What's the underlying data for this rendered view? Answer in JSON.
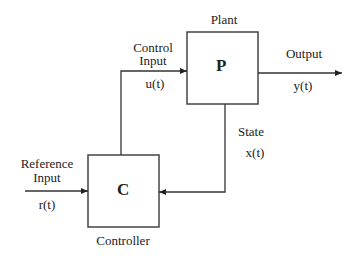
{
  "diagram": {
    "type": "control-system-block-diagram",
    "blocks": {
      "plant": {
        "symbol": "P",
        "title": "Plant"
      },
      "controller": {
        "symbol": "C",
        "title": "Controller"
      }
    },
    "signals": {
      "reference": {
        "line1": "Reference",
        "line2": "Input",
        "var": "r(t)"
      },
      "control": {
        "line1": "Control",
        "line2": "Input",
        "var": "u(t)"
      },
      "output": {
        "label": "Output",
        "var": "y(t)"
      },
      "state": {
        "label": "State",
        "var": "x(t)"
      }
    },
    "connections": [
      {
        "from": "reference",
        "to": "controller"
      },
      {
        "from": "controller",
        "to": "plant",
        "signal": "control"
      },
      {
        "from": "plant",
        "to": "output"
      },
      {
        "from": "plant",
        "to": "controller",
        "signal": "state"
      }
    ],
    "colors": {
      "line": "#333333",
      "text": "#222222",
      "background": "#ffffff"
    }
  }
}
